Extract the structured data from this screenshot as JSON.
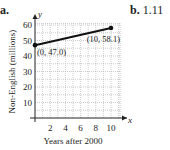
{
  "part_a": {
    "label": "a."
  },
  "part_b": {
    "label": "b.",
    "value": "1.11"
  },
  "chart_data": {
    "type": "line",
    "title": "",
    "xlabel": "Years after 2000",
    "ylabel": "Non-English (millions)",
    "x_axis_letter": "x",
    "y_axis_letter": "y",
    "xlim": [
      0,
      11
    ],
    "ylim": [
      0,
      62
    ],
    "x_ticks": [
      2,
      4,
      6,
      8,
      10
    ],
    "y_ticks": [
      10,
      20,
      30,
      40,
      50,
      60
    ],
    "grid": true,
    "series": [
      {
        "name": "Non-English speakers",
        "x": [
          0,
          10
        ],
        "y": [
          47.0,
          58.1
        ]
      }
    ],
    "annotations": [
      {
        "text": "(0, 47.0)",
        "x": 0,
        "y": 47.0
      },
      {
        "text": "(10, 58.1)",
        "x": 10,
        "y": 58.1
      }
    ]
  }
}
